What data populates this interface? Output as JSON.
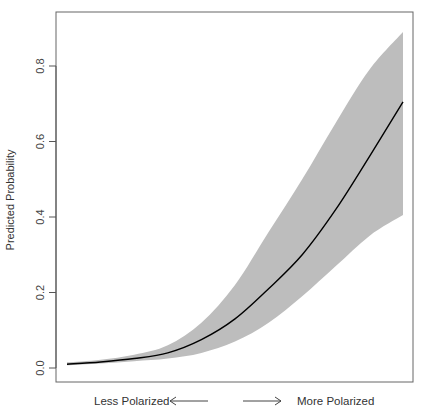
{
  "chart_data": {
    "type": "line",
    "title": "",
    "xlabel": "",
    "ylabel": "Predicted Probability",
    "x_annotations": {
      "left": "Less Polarized",
      "right": "More Polarized"
    },
    "x": [
      0.0,
      0.1,
      0.2,
      0.3,
      0.4,
      0.5,
      0.6,
      0.7,
      0.8,
      0.9,
      1.0
    ],
    "series": [
      {
        "name": "Predicted probability",
        "style": "line",
        "color": "#000000",
        "values": [
          0.01,
          0.016,
          0.025,
          0.04,
          0.075,
          0.13,
          0.21,
          0.3,
          0.42,
          0.56,
          0.705
        ]
      },
      {
        "name": "Upper bound",
        "style": "band-upper",
        "color": "#bdbdbd",
        "values": [
          0.015,
          0.022,
          0.035,
          0.06,
          0.12,
          0.22,
          0.36,
          0.5,
          0.65,
          0.79,
          0.89
        ]
      },
      {
        "name": "Lower bound",
        "style": "band-lower",
        "color": "#bdbdbd",
        "values": [
          0.007,
          0.012,
          0.018,
          0.025,
          0.04,
          0.07,
          0.12,
          0.19,
          0.27,
          0.35,
          0.405
        ]
      }
    ],
    "y_ticks": [
      0.0,
      0.2,
      0.4,
      0.6,
      0.8
    ],
    "y_tick_labels": [
      "0.0",
      "0.2",
      "0.4",
      "0.6",
      "0.8"
    ],
    "ylim": [
      0.0,
      0.92
    ],
    "grid": false,
    "legend": null
  },
  "colors": {
    "band": "#bdbdbd",
    "line": "#000000",
    "axis": "#555555"
  }
}
